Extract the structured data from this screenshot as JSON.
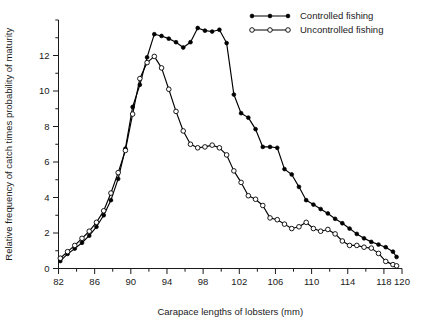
{
  "chart_data": {
    "type": "line",
    "title": "",
    "xlabel": "Carapace lengths of lobsters (mm)",
    "ylabel": "Relative frequency of catch times probability of maturity",
    "xlim": [
      82,
      120
    ],
    "ylim": [
      0,
      14
    ],
    "xticks": [
      82,
      86,
      90,
      94,
      98,
      102,
      106,
      110,
      114,
      118,
      120
    ],
    "xticklabels": [
      "82",
      "86",
      "90",
      "94",
      "98",
      "102",
      "106",
      "110",
      "114",
      "118",
      "120"
    ],
    "xminor_step": 2,
    "yticks": [
      0,
      2,
      4,
      6,
      8,
      10,
      12
    ],
    "yticklabels": [
      "0",
      "2",
      "4",
      "6",
      "8",
      "10",
      "12"
    ],
    "yminor_step": 1,
    "grid": false,
    "legend_position": "top-right",
    "series": [
      {
        "name": "Controlled fishing",
        "marker": "filled-circle",
        "x": [
          82.2,
          83.0,
          83.8,
          84.6,
          85.4,
          86.2,
          87.0,
          87.8,
          88.6,
          89.4,
          90.2,
          91.0,
          91.8,
          92.6,
          93.4,
          94.2,
          95.0,
          95.8,
          96.6,
          97.4,
          98.2,
          99.0,
          99.8,
          100.6,
          101.4,
          102.2,
          103.0,
          103.8,
          104.6,
          105.4,
          106.2,
          107.0,
          107.8,
          108.6,
          109.4,
          110.2,
          111.0,
          111.8,
          112.6,
          113.4,
          114.2,
          115.0,
          115.8,
          116.6,
          117.4,
          118.2,
          119.0,
          119.4
        ],
        "y": [
          0.42,
          0.82,
          1.12,
          1.45,
          1.85,
          2.35,
          3.0,
          3.85,
          5.05,
          6.75,
          9.1,
          10.35,
          11.9,
          13.2,
          13.1,
          12.95,
          12.75,
          12.45,
          12.75,
          13.55,
          13.4,
          13.35,
          13.45,
          12.7,
          9.8,
          8.75,
          8.5,
          7.85,
          6.85,
          6.85,
          6.8,
          5.6,
          5.3,
          4.6,
          3.85,
          3.6,
          3.35,
          3.1,
          2.8,
          2.55,
          2.25,
          1.95,
          1.7,
          1.5,
          1.35,
          1.2,
          0.95,
          0.65
        ]
      },
      {
        "name": "Uncontrolled fishing",
        "marker": "open-circle",
        "x": [
          82.2,
          83.0,
          83.8,
          84.6,
          85.4,
          86.2,
          87.0,
          87.8,
          88.6,
          89.4,
          90.2,
          91.0,
          91.8,
          92.6,
          93.4,
          94.2,
          95.0,
          95.8,
          96.6,
          97.4,
          98.2,
          99.0,
          99.8,
          100.6,
          101.4,
          102.2,
          103.0,
          103.8,
          104.6,
          105.4,
          106.2,
          107.0,
          107.8,
          108.6,
          109.4,
          110.2,
          111.0,
          111.8,
          112.6,
          113.4,
          114.2,
          115.0,
          115.8,
          116.6,
          117.4,
          118.2,
          119.0,
          119.4
        ],
        "y": [
          0.58,
          0.95,
          1.3,
          1.7,
          2.1,
          2.6,
          3.25,
          4.25,
          5.4,
          6.65,
          8.7,
          10.7,
          11.6,
          11.95,
          11.3,
          10.1,
          8.85,
          7.75,
          7.0,
          6.8,
          6.85,
          6.95,
          6.8,
          6.4,
          5.5,
          4.85,
          4.1,
          3.9,
          3.55,
          2.85,
          2.75,
          2.5,
          2.25,
          2.35,
          2.6,
          2.25,
          2.1,
          2.2,
          1.95,
          1.55,
          1.3,
          1.3,
          1.2,
          1.15,
          0.85,
          0.4,
          0.22,
          0.15
        ]
      }
    ]
  },
  "legend": {
    "entries": [
      {
        "label": "Controlled fishing",
        "marker": "filled-circle"
      },
      {
        "label": "Uncontrolled fishing",
        "marker": "open-circle"
      }
    ]
  }
}
